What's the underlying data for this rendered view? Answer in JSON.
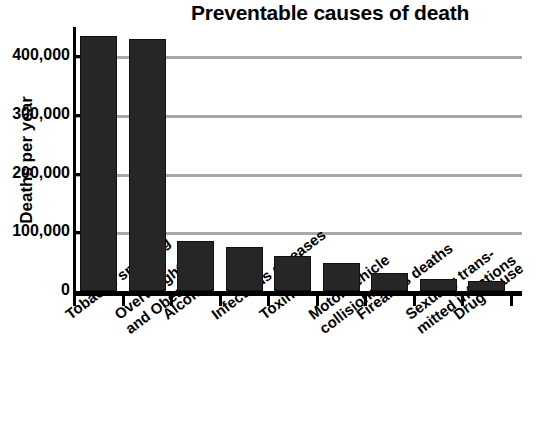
{
  "chart_data": {
    "type": "bar",
    "title": "Preventable causes of death",
    "xlabel": "",
    "ylabel": "Deaths per year",
    "ylim": [
      0,
      450000
    ],
    "grid": true,
    "legend": "none",
    "orientation": "vertical",
    "bar_color": "#262626",
    "gridline_color": "#a8a8a8",
    "axis_color": "#000000",
    "categories": [
      "Tobacco smoking",
      "Overweight and Obesity",
      "Alcohol",
      "Infectious diseases",
      "Toxins",
      "Motor vehicle collisions",
      "Firearms deaths",
      "Sexually transmitted infections",
      "Drug abuse"
    ],
    "category_lines": [
      [
        "Tobacco smoking"
      ],
      [
        "Overweight",
        "and Obesity"
      ],
      [
        "Alcohol"
      ],
      [
        "Infectious diseases"
      ],
      [
        "Toxins"
      ],
      [
        "Motor vehicle",
        "collisions"
      ],
      [
        "Firearms deaths"
      ],
      [
        "Sexually trans-",
        "mitted infections"
      ],
      [
        "Drug abuse"
      ]
    ],
    "values": [
      435000,
      430000,
      85000,
      75000,
      59000,
      47000,
      31000,
      20000,
      17000
    ],
    "yticks": [
      0,
      100000,
      200000,
      300000,
      400000
    ],
    "ytick_labels": [
      "0",
      "100,000",
      "200,000",
      "300,000",
      "400,000"
    ]
  }
}
